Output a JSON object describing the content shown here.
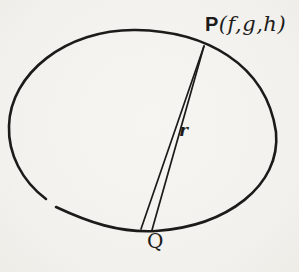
{
  "figure": {
    "point_p": {
      "prefix": "P",
      "args": "(f,g,h)"
    },
    "radius_label": "r",
    "point_q": "Q"
  },
  "colors": {
    "ink": "#1d1b19",
    "background": "#f3f2ee"
  }
}
